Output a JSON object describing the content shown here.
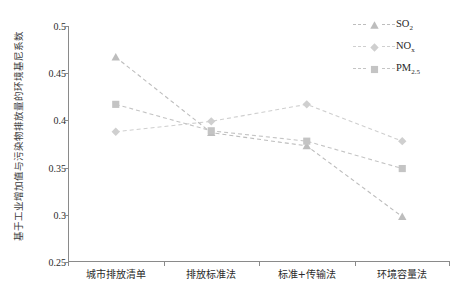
{
  "chart_data": {
    "type": "line",
    "title": "",
    "xlabel": "",
    "ylabel": "基于工业增加值与污染物排放量的环境基尼系数",
    "categories": [
      "城市排放清单",
      "排放标准法",
      "标准+传输法",
      "环境容量法"
    ],
    "ylim": [
      0.25,
      0.5
    ],
    "yticks": [
      "0.25",
      "0.3",
      "0.35",
      "0.4",
      "0.45",
      "0.5"
    ],
    "ytick_values": [
      0.25,
      0.3,
      0.35,
      0.4,
      0.45,
      0.5
    ],
    "grid": false,
    "legend_position": "top-right",
    "series": [
      {
        "name": "SO2",
        "label_base": "SO",
        "label_sub": "2",
        "marker": "triangle",
        "linestyle": "dashed",
        "color": "#bdbdbd",
        "values": [
          0.467,
          0.387,
          0.373,
          0.298
        ]
      },
      {
        "name": "NOx",
        "label_base": "NO",
        "label_sub": "x",
        "marker": "diamond",
        "linestyle": "dashed",
        "color": "#cfcfcf",
        "values": [
          0.388,
          0.399,
          0.417,
          0.378
        ]
      },
      {
        "name": "PM2.5",
        "label_base": "PM",
        "label_sub": "2.5",
        "marker": "square",
        "linestyle": "dashed",
        "color": "#c4c4c4",
        "values": [
          0.417,
          0.389,
          0.378,
          0.349
        ]
      }
    ]
  },
  "axis": {
    "line_color": "#8a8a8a"
  }
}
